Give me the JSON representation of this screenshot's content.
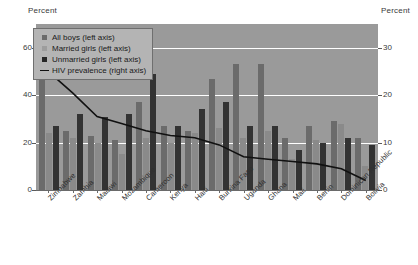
{
  "left_axis_title": "Percent",
  "right_axis_title": "Percent",
  "legend": {
    "items": [
      {
        "label": "All boys (left axis)",
        "key": "boys",
        "marker": "square",
        "color": "#6b6b6b"
      },
      {
        "label": "Married girls (left axis)",
        "key": "married",
        "marker": "square",
        "color": "#9d9d9d"
      },
      {
        "label": "Unmarried girls (left axis)",
        "key": "unmarried",
        "marker": "square",
        "color": "#262626"
      },
      {
        "label": "HIV prevalence (right axis)",
        "key": "hiv",
        "marker": "line",
        "color": "#111111"
      }
    ]
  },
  "chart_data": {
    "type": "bar",
    "title": "",
    "xlabel": "",
    "ylabel": "Percent",
    "y2label": "Percent",
    "ylim": [
      0,
      70
    ],
    "y2lim": [
      0,
      35
    ],
    "yticks": [
      0,
      20,
      40,
      60
    ],
    "y2ticks": [
      0,
      10,
      20,
      30
    ],
    "grid": true,
    "legend_position": "top-left",
    "categories": [
      "Zimbabwe",
      "Zambia",
      "Malawi",
      "Mozambique",
      "Cameroon",
      "Kenya",
      "Haiti",
      "Burkina Faso",
      "Uganda",
      "Ghana",
      "Mali",
      "Benin",
      "Dominican Republic",
      "Bolivia"
    ],
    "series": [
      {
        "name": "All boys (left axis)",
        "axis": "left",
        "color": "#6b6b6b",
        "values": [
          49,
          25,
          23,
          21,
          37,
          27,
          25,
          47,
          53,
          53,
          22,
          27,
          29,
          22
        ]
      },
      {
        "name": "Married girls (left axis)",
        "axis": "left",
        "color": "#9d9d9d",
        "values": [
          24,
          22,
          20,
          15,
          22,
          20,
          24,
          26,
          22,
          25,
          13,
          21,
          28,
          10
        ]
      },
      {
        "name": "Unmarried girls (left axis)",
        "axis": "left",
        "color": "#262626",
        "values": [
          27,
          32,
          31,
          32,
          49,
          27,
          34,
          37,
          27,
          27,
          17,
          20,
          22,
          19
        ]
      }
    ],
    "line_series": {
      "name": "HIV prevalence (right axis)",
      "axis": "right",
      "color": "#111111",
      "values": [
        25.0,
        20.5,
        15.5,
        14.0,
        12.5,
        11.5,
        11.0,
        9.5,
        7.0,
        6.5,
        6.0,
        5.5,
        4.5,
        2.0
      ]
    }
  }
}
